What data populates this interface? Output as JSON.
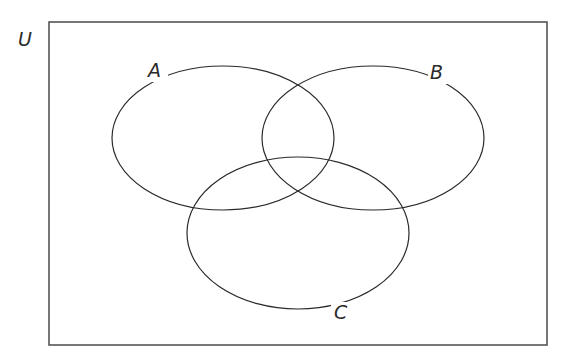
{
  "diagram": {
    "type": "venn",
    "universe": {
      "label": "U",
      "x": 49,
      "y": 22,
      "width": 498,
      "height": 323
    },
    "sets": [
      {
        "label": "A",
        "cx": 223,
        "cy": 138,
        "rx": 111,
        "ry": 72,
        "label_x": 156,
        "label_y": 75
      },
      {
        "label": "B",
        "cx": 373,
        "cy": 138,
        "rx": 111,
        "ry": 72,
        "label_x": 438,
        "label_y": 77
      },
      {
        "label": "C",
        "cx": 298,
        "cy": 233,
        "rx": 111,
        "ry": 76,
        "label_x": 341,
        "label_y": 318
      }
    ],
    "colors": {
      "stroke": "#2a2a2a",
      "frame": "#555555",
      "background": "#ffffff"
    }
  }
}
